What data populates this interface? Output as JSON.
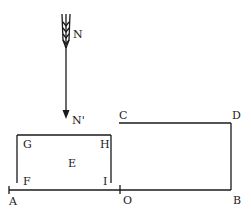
{
  "diagram": {
    "type": "physics line diagram",
    "stroke_color": "#1a1a1a",
    "background": "#ffffff",
    "arrow": {
      "from_label": "N",
      "to_label": "N'",
      "direction": "down",
      "style": "feathered arrow"
    },
    "labels": {
      "N": "N",
      "N_prime": "N'",
      "C": "C",
      "D": "D",
      "G": "G",
      "H": "H",
      "E": "E",
      "F": "F",
      "I": "I",
      "A": "A",
      "O": "O",
      "B": "B"
    },
    "shapes": [
      {
        "name": "rectangle-GHIF",
        "corners": [
          "G",
          "H",
          "I",
          "F"
        ],
        "center_label": "E",
        "open_bottom": true
      },
      {
        "name": "baseline-AOB",
        "points": [
          "A",
          "O",
          "B"
        ]
      },
      {
        "name": "line-CD",
        "points": [
          "C",
          "D"
        ]
      },
      {
        "name": "line-DB",
        "points": [
          "D",
          "B"
        ]
      }
    ]
  }
}
